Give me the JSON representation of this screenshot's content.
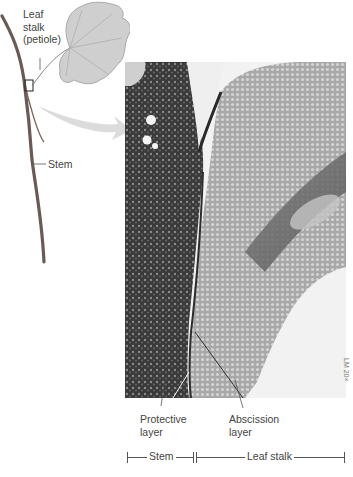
{
  "figure": {
    "labels": {
      "leaf_stalk": [
        "Leaf",
        "stalk",
        "(petiole)"
      ],
      "stem": "Stem",
      "protective_layer": [
        "Protective",
        "layer"
      ],
      "abscission_layer": [
        "Abscission",
        "layer"
      ],
      "scale_note": "LM 20×"
    },
    "bracket_bar": {
      "stem_segment": "Stem",
      "leaf_stalk_segment": "Leaf stalk"
    },
    "colors": {
      "text": "#444444",
      "leaf": "#c8c8c8",
      "arrow": "#d9d9d9",
      "stem_tissue": "#3c3c3c",
      "leaf_tissue": "#b5b5b5"
    }
  }
}
